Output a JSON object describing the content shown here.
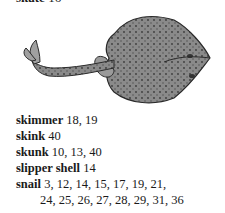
{
  "clipped_heading": {
    "term": "skate",
    "pages": " 16"
  },
  "illustration": {
    "subject": "skate-fish-drawing"
  },
  "entries": [
    {
      "term": "skimmer",
      "pages": " 18, 19"
    },
    {
      "term": "skink",
      "pages": " 40"
    },
    {
      "term": "skunk",
      "pages": " 10, 13, 40"
    },
    {
      "term": "slipper shell",
      "pages": " 14"
    },
    {
      "term": "snail",
      "pages": " 3, 12, 14, 15, 17, 19, 21,",
      "continuation": "24, 25, 26, 27, 28, 29, 31, 36"
    }
  ]
}
